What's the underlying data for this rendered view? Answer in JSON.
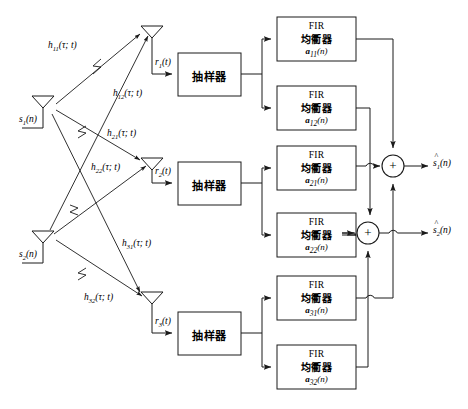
{
  "diagram": {
    "colors": {
      "line": "#1a1a1a",
      "background": "#ffffff",
      "text": "#000000"
    },
    "transmit_antennas": [
      {
        "name": "tx-1",
        "signal": "s",
        "signal_sub": "1",
        "signal_arg": "(n)",
        "x": 43,
        "y": 103
      },
      {
        "name": "tx-2",
        "signal": "s",
        "signal_sub": "2",
        "signal_arg": "(n)",
        "x": 43,
        "y": 238
      }
    ],
    "receive_antennas": [
      {
        "name": "rx-1",
        "signal": "r",
        "signal_sub": "1",
        "signal_arg": "(t)",
        "x": 152,
        "y": 31
      },
      {
        "name": "rx-2",
        "signal": "r",
        "signal_sub": "2",
        "signal_arg": "(t)",
        "x": 152,
        "y": 163
      },
      {
        "name": "rx-3",
        "signal": "r",
        "signal_sub": "3",
        "signal_arg": "(t)",
        "x": 152,
        "y": 297
      }
    ],
    "channel_labels": [
      {
        "h": "h",
        "sub": "11",
        "arg": "(τ; t)",
        "x": 48,
        "y": 40
      },
      {
        "h": "h",
        "sub": "12",
        "arg": "(τ; t)",
        "x": 113,
        "y": 88
      },
      {
        "h": "h",
        "sub": "21",
        "arg": "(τ; t)",
        "x": 107,
        "y": 128
      },
      {
        "h": "h",
        "sub": "22",
        "arg": "(τ; t)",
        "x": 91,
        "y": 162
      },
      {
        "h": "h",
        "sub": "31",
        "arg": "(τ; t)",
        "x": 122,
        "y": 238
      },
      {
        "h": "h",
        "sub": "32",
        "arg": "(τ; t)",
        "x": 84,
        "y": 292
      }
    ],
    "samplers": [
      {
        "name": "sampler-1",
        "label": "抽样器",
        "x": 178,
        "y": 53,
        "w": 63,
        "h": 43
      },
      {
        "name": "sampler-2",
        "label": "抽样器",
        "x": 178,
        "y": 162,
        "w": 63,
        "h": 43
      },
      {
        "name": "sampler-3",
        "label": "抽样器",
        "x": 178,
        "y": 312,
        "w": 63,
        "h": 43
      }
    ],
    "fir_blocks": [
      {
        "name": "fir-a11",
        "line1": "FIR",
        "line2": "均衢器",
        "coef": "a",
        "coef_sub": "11",
        "coef_arg": "(n)",
        "x": 277,
        "y": 17,
        "w": 79,
        "h": 44
      },
      {
        "name": "fir-a12",
        "line1": "FIR",
        "line2": "均衢器",
        "coef": "a",
        "coef_sub": "12",
        "coef_arg": "(n)",
        "x": 277,
        "y": 86,
        "w": 79,
        "h": 44
      },
      {
        "name": "fir-a21",
        "line1": "FIR",
        "line2": "均衢器",
        "coef": "a",
        "coef_sub": "21",
        "coef_arg": "(n)",
        "x": 277,
        "y": 146,
        "w": 79,
        "h": 44
      },
      {
        "name": "fir-a22",
        "line1": "FIR",
        "line2": "均衢器",
        "coef": "a",
        "coef_sub": "22",
        "coef_arg": "(n)",
        "x": 277,
        "y": 213,
        "w": 79,
        "h": 44
      },
      {
        "name": "fir-a31",
        "line1": "FIR",
        "line2": "均衢器",
        "coef": "a",
        "coef_sub": "31",
        "coef_arg": "(n)",
        "x": 277,
        "y": 276,
        "w": 79,
        "h": 44
      },
      {
        "name": "fir-a32",
        "line1": "FIR",
        "line2": "均衢器",
        "coef": "a",
        "coef_sub": "32",
        "coef_arg": "(n)",
        "x": 277,
        "y": 345,
        "w": 79,
        "h": 44
      }
    ],
    "summers": [
      {
        "name": "summer-1",
        "symbol": "+",
        "cx": 393,
        "cy": 166,
        "r": 11
      },
      {
        "name": "summer-2",
        "symbol": "+",
        "cx": 368,
        "cy": 233,
        "r": 11
      }
    ],
    "outputs": [
      {
        "name": "output-s1-hat",
        "s": "s",
        "sub": "1",
        "arg": "(n)",
        "x": 437,
        "y": 159
      },
      {
        "name": "output-s2-hat",
        "s": "s",
        "sub": "2",
        "arg": "(n)",
        "x": 437,
        "y": 226
      }
    ]
  }
}
